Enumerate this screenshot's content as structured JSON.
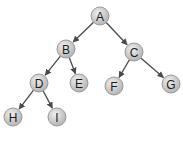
{
  "diagram": {
    "type": "binary-tree",
    "colors": {
      "node_fill_light": "#e8e8e8",
      "node_fill_dark": "#b8b8b8",
      "node_border": "#9a9a9a",
      "edge": "#4a4a4a",
      "label": "#1a1a1a"
    },
    "node_radius": 9,
    "nodes": [
      {
        "id": "A",
        "label": "A",
        "x": 100,
        "y": 16
      },
      {
        "id": "B",
        "label": "B",
        "x": 66,
        "y": 49
      },
      {
        "id": "C",
        "label": "C",
        "x": 134,
        "y": 52
      },
      {
        "id": "D",
        "label": "D",
        "x": 39,
        "y": 83
      },
      {
        "id": "E",
        "label": "E",
        "x": 79,
        "y": 83
      },
      {
        "id": "F",
        "label": "F",
        "x": 114,
        "y": 86
      },
      {
        "id": "G",
        "label": "G",
        "x": 171,
        "y": 84
      },
      {
        "id": "H",
        "label": "H",
        "x": 13,
        "y": 117
      },
      {
        "id": "I",
        "label": "I",
        "x": 57,
        "y": 117
      }
    ],
    "edges": [
      {
        "from": "A",
        "to": "B"
      },
      {
        "from": "A",
        "to": "C"
      },
      {
        "from": "B",
        "to": "D"
      },
      {
        "from": "B",
        "to": "E"
      },
      {
        "from": "C",
        "to": "F"
      },
      {
        "from": "C",
        "to": "G"
      },
      {
        "from": "D",
        "to": "H"
      },
      {
        "from": "D",
        "to": "I"
      }
    ]
  }
}
